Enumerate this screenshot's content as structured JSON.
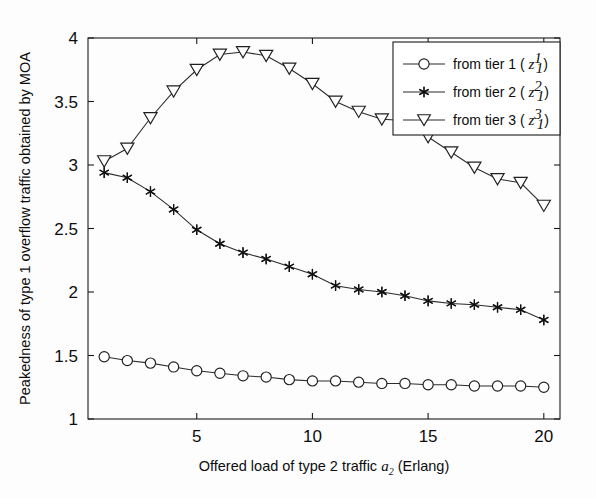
{
  "figure": {
    "background_color": "#fdfdfd",
    "axis_color": "#1a1a1a",
    "series_color": "#2b2b2b"
  },
  "axes": {
    "x_ticks": [
      "5",
      "10",
      "15",
      "20"
    ],
    "x_tick_values": [
      5,
      10,
      15,
      20
    ],
    "y_ticks": [
      "1",
      "1.5",
      "2",
      "2.5",
      "3",
      "3.5",
      "4"
    ],
    "y_tick_values": [
      1,
      1.5,
      2,
      2.5,
      3,
      3.5,
      4
    ],
    "xlabel_part1": "Offered load of type 2 traffic",
    "xlabel_symbol": "a",
    "xlabel_symbol_sub": "2",
    "xlabel_part2": "(Erlang)",
    "ylabel": "Peakedness of type 1 overflow traffic obtained by MOA"
  },
  "legend": {
    "position": "top-right",
    "entries": [
      {
        "label": "from tier 1 (",
        "symbol": "z",
        "sup": "1",
        "sub": "1",
        "close": ")",
        "marker": "circle-marker"
      },
      {
        "label": "from tier 2 (",
        "symbol": "z",
        "sup": "2",
        "sub": "1",
        "close": ")",
        "marker": "asterisk-marker"
      },
      {
        "label": "from tier 3 (",
        "symbol": "z",
        "sup": "3",
        "sub": "1",
        "close": ")",
        "marker": "triangle-down-marker"
      }
    ]
  },
  "chart_data": {
    "type": "line",
    "title": "",
    "xlabel": "Offered load of type 2 traffic a_2 (Erlang)",
    "ylabel": "Peakedness of type 1 overflow traffic obtained by MOA",
    "xlim": [
      0.3,
      20.7
    ],
    "ylim": [
      1,
      4
    ],
    "grid": false,
    "legend_position": "upper right",
    "x": [
      1,
      2,
      3,
      4,
      5,
      6,
      7,
      8,
      9,
      10,
      11,
      12,
      13,
      14,
      15,
      16,
      17,
      18,
      19,
      20
    ],
    "series": [
      {
        "name": "from tier 1 ( z_1^1 )",
        "marker": "circle",
        "values": [
          1.49,
          1.46,
          1.44,
          1.41,
          1.38,
          1.36,
          1.34,
          1.33,
          1.31,
          1.3,
          1.3,
          1.29,
          1.28,
          1.28,
          1.27,
          1.27,
          1.26,
          1.26,
          1.26,
          1.25
        ]
      },
      {
        "name": "from tier 2 ( z_1^2 )",
        "marker": "asterisk",
        "values": [
          2.94,
          2.9,
          2.79,
          2.65,
          2.49,
          2.38,
          2.31,
          2.26,
          2.2,
          2.14,
          2.05,
          2.02,
          2.0,
          1.97,
          1.93,
          1.91,
          1.9,
          1.88,
          1.86,
          1.78
        ]
      },
      {
        "name": "from tier 3 ( z_1^3 )",
        "marker": "triangle-down",
        "values": [
          3.03,
          3.13,
          3.37,
          3.58,
          3.75,
          3.87,
          3.89,
          3.86,
          3.76,
          3.64,
          3.5,
          3.42,
          3.36,
          3.35,
          3.22,
          3.1,
          2.98,
          2.89,
          2.86,
          2.68
        ]
      }
    ]
  }
}
